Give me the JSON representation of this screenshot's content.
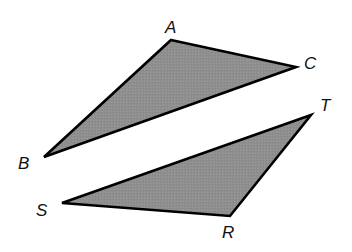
{
  "diagram": {
    "fill_color": "#8f8f8f",
    "stroke_color": "#000000",
    "triangles": [
      {
        "name": "ABC",
        "vertices": [
          {
            "label": "A",
            "x": 171,
            "y": 40,
            "lx": 165,
            "ly": 33
          },
          {
            "label": "C",
            "x": 296,
            "y": 67,
            "lx": 304,
            "ly": 69
          },
          {
            "label": "B",
            "x": 44,
            "y": 157,
            "lx": 18,
            "ly": 169
          }
        ]
      },
      {
        "name": "RST",
        "vertices": [
          {
            "label": "T",
            "x": 311,
            "y": 115,
            "lx": 320,
            "ly": 111
          },
          {
            "label": "S",
            "x": 62,
            "y": 203,
            "lx": 36,
            "ly": 216
          },
          {
            "label": "R",
            "x": 230,
            "y": 216,
            "lx": 222,
            "ly": 238
          }
        ]
      }
    ]
  }
}
